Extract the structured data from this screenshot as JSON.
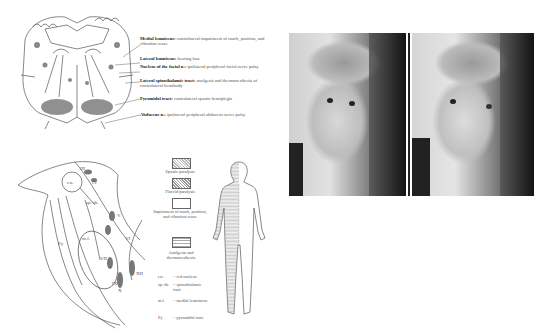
{
  "figure": {
    "top_diagram": {
      "title": "Pons cross-section lesion",
      "labels": [
        {
          "term": "Medial lemniscus:",
          "desc": "contralateral impairment of touch, position, and vibration sense"
        },
        {
          "term": "Lateral lemniscus:",
          "desc": "hearing loss"
        },
        {
          "term": "Nucleus of the facial n.:",
          "desc": "ipsilateral peripheral facial nerve palsy"
        },
        {
          "term": "Lateral spinothalamic tract:",
          "desc": "analgesia and thermanesthesia of contralateral hemibody"
        },
        {
          "term": "Pyramidal tract:",
          "desc": "contralateral spastic hemiplegia"
        },
        {
          "term": "Abducens n.:",
          "desc": "ipsilateral peripheral abducens nerve palsy"
        }
      ]
    },
    "sagittal_diagram": {
      "labels": [
        "r.n.",
        "III",
        "IV",
        "sp.-th.",
        "V",
        "Py",
        "m.l.",
        "VI",
        "VII",
        "IX",
        "X",
        "XII"
      ]
    },
    "legend": {
      "items": [
        {
          "pattern": "dots",
          "label": "Spastic paralysis"
        },
        {
          "pattern": "crosshatch",
          "label": "Flaccid paralysis"
        },
        {
          "pattern": "blank",
          "label": "Impairment of touch, position, and vibration sense"
        },
        {
          "pattern": "hlines",
          "label": "Analgesia and thermanesthesia"
        }
      ],
      "abbreviations": [
        {
          "abbr": "r.n.",
          "meaning": "= red nucleus"
        },
        {
          "abbr": "sp.-th.",
          "meaning": "= spinothalamic tract"
        },
        {
          "abbr": "m.l.",
          "meaning": "= medial lemniscus"
        },
        {
          "abbr": "Py",
          "meaning": "= pyramidal tract"
        }
      ]
    },
    "photos": [
      {
        "name": "patient-photo-left",
        "alt": "Patient face, looking forward"
      },
      {
        "name": "patient-photo-right",
        "alt": "Patient face, attempting lateral gaze"
      }
    ]
  }
}
